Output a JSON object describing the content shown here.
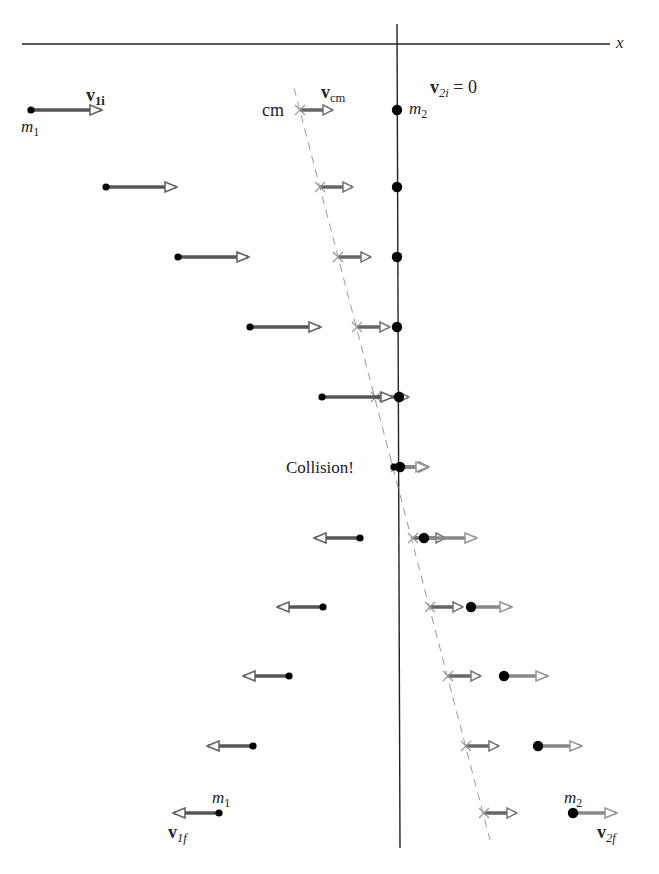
{
  "labels": {
    "x_axis": "x",
    "v1i": {
      "base": "v",
      "sub": "1i"
    },
    "m1_top": {
      "base": "m",
      "sub": "1"
    },
    "vcm": {
      "base": "v",
      "sub": "cm"
    },
    "cm": "cm",
    "v2i": {
      "base": "v",
      "sub": "2i",
      "suffix": " = 0"
    },
    "m2_top": {
      "base": "m",
      "sub": "2"
    },
    "collision": "Collision!",
    "m1_bottom": {
      "base": "m",
      "sub": "1"
    },
    "v1f": {
      "base": "v",
      "sub": "1f"
    },
    "m2_bottom": {
      "base": "m",
      "sub": "2"
    },
    "v2f": {
      "base": "v",
      "sub": "2f"
    }
  },
  "colors": {
    "axis": "#222222",
    "m1_arrow": "#555555",
    "m2_arrow": "#888888",
    "cm_arrow": "#666666",
    "cm_line": "#999999",
    "dot": "#000000"
  },
  "frames": [
    {
      "y": 110,
      "m1": 31,
      "v1": 70,
      "cm": 300,
      "m2": 397,
      "v2": 0
    },
    {
      "y": 187,
      "m1": 106,
      "v1": 70,
      "cm": 320,
      "m2": 397,
      "v2": 0
    },
    {
      "y": 257,
      "m1": 178,
      "v1": 70,
      "cm": 338,
      "m2": 397,
      "v2": 0
    },
    {
      "y": 327,
      "m1": 250,
      "v1": 70,
      "cm": 357,
      "m2": 397,
      "v2": 0
    },
    {
      "y": 397,
      "m1": 322,
      "v1": 70,
      "cm": 376,
      "m2": 399,
      "v2": 0
    },
    {
      "y": 467,
      "m1": 394,
      "v1": 0,
      "cm": 396,
      "m2": 400,
      "v2": 27
    },
    {
      "y": 538,
      "m1": 360,
      "v1": -45,
      "cm": 413,
      "m2": 424,
      "v2": 52
    },
    {
      "y": 607,
      "m1": 323,
      "v1": -45,
      "cm": 430,
      "m2": 471,
      "v2": 40
    },
    {
      "y": 676,
      "m1": 289,
      "v1": -45,
      "cm": 448,
      "m2": 504,
      "v2": 43
    },
    {
      "y": 746,
      "m1": 253,
      "v1": -45,
      "cm": 466,
      "m2": 538,
      "v2": 43
    },
    {
      "y": 813,
      "m1": 219,
      "v1": -45,
      "cm": 484,
      "m2": 573,
      "v2": 43
    }
  ],
  "vcm_length": 32
}
